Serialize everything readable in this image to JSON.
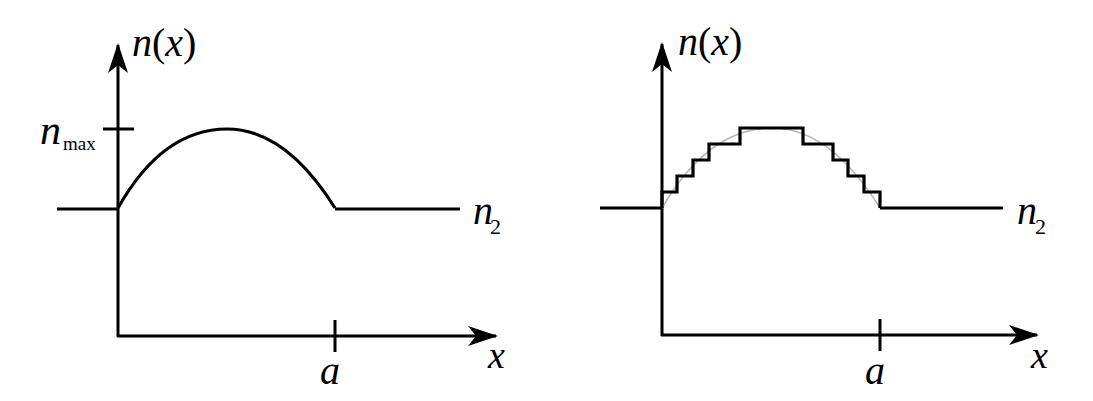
{
  "figure": {
    "colors": {
      "stroke": "#000000",
      "guide_curve": "#b8b8b8",
      "background": "#ffffff"
    }
  },
  "left_panel": {
    "y_axis_label": "n(x)",
    "x_axis_label": "x",
    "tick_label_a": "a",
    "nmax_label_main": "n",
    "nmax_label_sub": "max",
    "n2_label_main": "n",
    "n2_label_sub": "2",
    "profile": "smooth-curve"
  },
  "right_panel": {
    "y_axis_label": "n(x)",
    "x_axis_label": "x",
    "tick_label_a": "a",
    "n2_label_main": "n",
    "n2_label_sub": "2",
    "profile": "staircase-approximation",
    "step_count_rising": 4,
    "step_count_falling": 5
  }
}
